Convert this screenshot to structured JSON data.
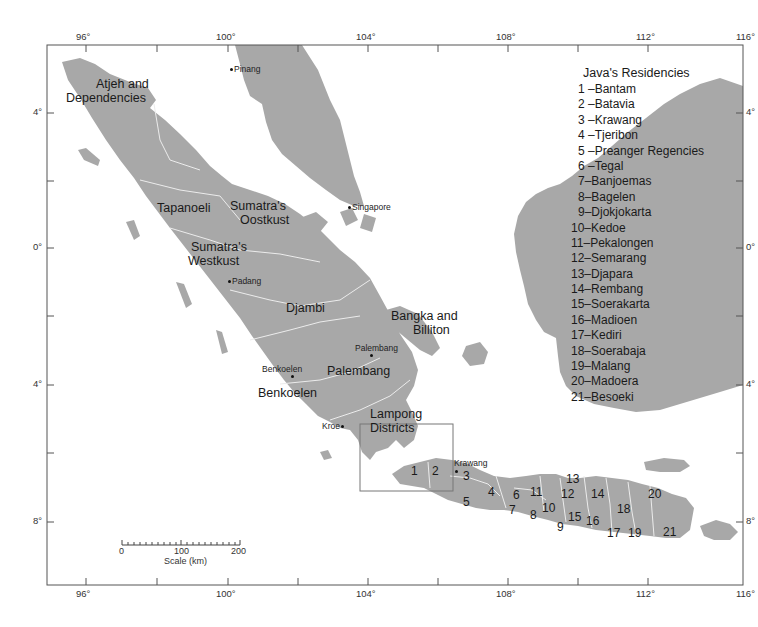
{
  "map": {
    "colors": {
      "land": "#a8a8a8",
      "sea": "#ffffff",
      "border": "#e8e8e8",
      "frame": "#555555",
      "text": "#1a1a1a"
    },
    "longitude_ticks": [
      "96°",
      "100°",
      "104°",
      "108°",
      "112°",
      "116°"
    ],
    "latitude_ticks_left": [
      "4°",
      "0°",
      "4°",
      "8°"
    ],
    "latitude_ticks_right": [
      "4°",
      "0°",
      "4°",
      "8°"
    ],
    "regions": {
      "atjeh_line1": "Atjeh and",
      "atjeh_line2": "Dependencies",
      "tapanoeli": "Tapanoeli",
      "oostkust_line1": "Sumatra's",
      "oostkust_line2": "Oostkust",
      "westkust_line1": "Sumatra's",
      "westkust_line2": "Westkust",
      "djambi": "Djambi",
      "bangka_line1": "Bangka and",
      "bangka_line2": "Billiton",
      "palembang": "Palembang",
      "benkoelen": "Benkoelen",
      "lampong_line1": "Lampong",
      "lampong_line2": "Districts"
    },
    "cities": {
      "pinang": "Pinang",
      "singapore": "Singapore",
      "padang": "Padang",
      "palembang": "Palembang",
      "benkoelen": "Benkoelen",
      "kroe": "Kroe",
      "krawang": "Krawang"
    },
    "java_numbers": [
      "1",
      "2",
      "3",
      "4",
      "5",
      "6",
      "7",
      "8",
      "9",
      "10",
      "11",
      "12",
      "13",
      "14",
      "15",
      "16",
      "17",
      "18",
      "19",
      "20",
      "21"
    ],
    "scale": {
      "ticks": [
        "0",
        "100",
        "200"
      ],
      "label": "Scale (km)"
    }
  },
  "legend": {
    "title": "Java's Residencies",
    "items": [
      "1 –Bantam",
      "2 –Batavia",
      "3 –Krawang",
      "4 –Tjeribon",
      "5 –Preanger Regencies",
      "6 –Tegal",
      "7–Banjoemas",
      "8–Bagelen",
      "9–Djokjokarta",
      "10–Kedoe",
      "11–Pekalongen",
      "12–Semarang",
      "13–Djapara",
      "14–Rembang",
      "15–Soerakarta",
      "16–Madioen",
      "17–Kediri",
      "18–Soerabaja",
      "19–Malang",
      "20–Madoera",
      "21–Besoeki"
    ]
  }
}
